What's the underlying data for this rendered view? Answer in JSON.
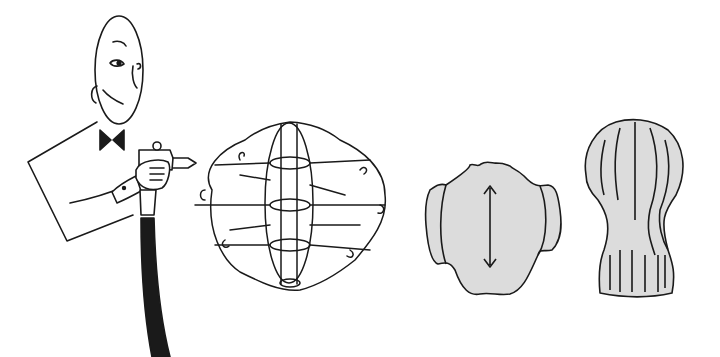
{
  "illustration": {
    "description": "Line illustration: man in bow tie with spray gun coating a wire lamp frame, then two finished cocoon lamp shades",
    "colors": {
      "line": "#1a1a1a",
      "fill": "#dcdcdc",
      "background": "#ffffff"
    },
    "figures": [
      {
        "name": "man-with-spray-gun"
      },
      {
        "name": "wire-frame"
      },
      {
        "name": "cocoon-shade-wide"
      },
      {
        "name": "cocoon-shade-tall"
      }
    ]
  }
}
